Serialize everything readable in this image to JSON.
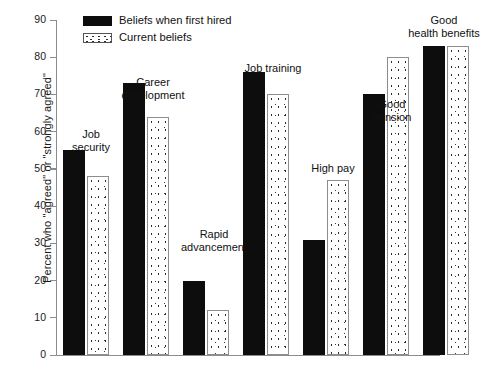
{
  "chart_data": {
    "type": "bar",
    "title": "",
    "xlabel": "",
    "ylabel": "Percent who \"agreed\" or \"strongly agreed\"",
    "ylim": [
      0,
      90
    ],
    "yticks": [
      0,
      10,
      20,
      30,
      40,
      50,
      60,
      70,
      80,
      90
    ],
    "grid": false,
    "legend_position": "top-left-inside",
    "categories": [
      "Job\nsecurity",
      "Career\ndevelopment",
      "Rapid\nadvancement",
      "Job training",
      "High pay",
      "Good\npension",
      "Good\nhealth benefits"
    ],
    "series": [
      {
        "name": "Beliefs when first hired",
        "pattern": "solid-black",
        "values": [
          55,
          73,
          20,
          76,
          31,
          70,
          83
        ]
      },
      {
        "name": "Current beliefs",
        "pattern": "dotted-stipple",
        "values": [
          48,
          64,
          12,
          70,
          47,
          80,
          83
        ]
      }
    ]
  },
  "axis": {
    "tick_labels": [
      "0",
      "10",
      "20",
      "30",
      "40",
      "50",
      "60",
      "70",
      "80",
      "90"
    ],
    "y_label": "Percent who \"agreed\" or \"strongly agreed\""
  },
  "legend": {
    "items": [
      {
        "label": "Beliefs when first hired",
        "pattern": "solid"
      },
      {
        "label": "Current beliefs",
        "pattern": "dotted"
      }
    ]
  },
  "category_labels": [
    {
      "line1": "Job",
      "line2": "security"
    },
    {
      "line1": "Career",
      "line2": "development"
    },
    {
      "line1": "Rapid",
      "line2": "advancement"
    },
    {
      "line1": "Job training",
      "line2": ""
    },
    {
      "line1": "High pay",
      "line2": ""
    },
    {
      "line1": "Good",
      "line2": "pension"
    },
    {
      "line1": "Good",
      "line2": "health benefits"
    }
  ]
}
